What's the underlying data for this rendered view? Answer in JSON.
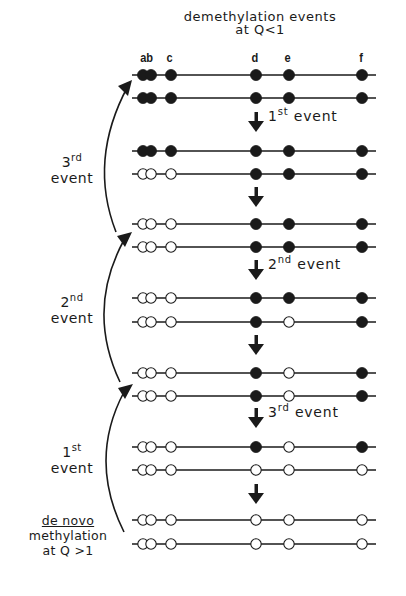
{
  "header": {
    "title_line1": "demethylation events",
    "title_line2": "at Q<1"
  },
  "sites": [
    {
      "label": "ab",
      "x": 147
    },
    {
      "label": "c",
      "x": 171
    },
    {
      "label": "d",
      "x": 256
    },
    {
      "label": "e",
      "x": 289
    },
    {
      "label": "f",
      "x": 362
    }
  ],
  "site_positions": {
    "a": 143,
    "b": 151,
    "c": 171,
    "d": 256,
    "e": 289,
    "f": 362
  },
  "strand_rows": [
    {
      "y": 75,
      "methylated": {
        "a": true,
        "b": true,
        "c": true,
        "d": true,
        "e": true,
        "f": true
      }
    },
    {
      "y": 98,
      "methylated": {
        "a": true,
        "b": true,
        "c": true,
        "d": true,
        "e": true,
        "f": true
      }
    },
    {
      "y": 151,
      "methylated": {
        "a": true,
        "b": true,
        "c": true,
        "d": true,
        "e": true,
        "f": true
      }
    },
    {
      "y": 174,
      "methylated": {
        "a": false,
        "b": false,
        "c": false,
        "d": true,
        "e": true,
        "f": true
      }
    },
    {
      "y": 224,
      "methylated": {
        "a": false,
        "b": false,
        "c": false,
        "d": true,
        "e": true,
        "f": true
      }
    },
    {
      "y": 247,
      "methylated": {
        "a": false,
        "b": false,
        "c": false,
        "d": true,
        "e": true,
        "f": true
      }
    },
    {
      "y": 298,
      "methylated": {
        "a": false,
        "b": false,
        "c": false,
        "d": true,
        "e": true,
        "f": true
      }
    },
    {
      "y": 322,
      "methylated": {
        "a": false,
        "b": false,
        "c": false,
        "d": true,
        "e": false,
        "f": true
      }
    },
    {
      "y": 373,
      "methylated": {
        "a": false,
        "b": false,
        "c": false,
        "d": true,
        "e": false,
        "f": true
      }
    },
    {
      "y": 396,
      "methylated": {
        "a": false,
        "b": false,
        "c": false,
        "d": true,
        "e": false,
        "f": true
      }
    },
    {
      "y": 447,
      "methylated": {
        "a": false,
        "b": false,
        "c": false,
        "d": true,
        "e": false,
        "f": true
      }
    },
    {
      "y": 470,
      "methylated": {
        "a": false,
        "b": false,
        "c": false,
        "d": false,
        "e": false,
        "f": false
      }
    },
    {
      "y": 520,
      "methylated": {
        "a": false,
        "b": false,
        "c": false,
        "d": false,
        "e": false,
        "f": false
      }
    },
    {
      "y": 544,
      "methylated": {
        "a": false,
        "b": false,
        "c": false,
        "d": false,
        "e": false,
        "f": false
      }
    }
  ],
  "down_arrows": [
    {
      "y": 112,
      "label_num": "1",
      "label_sup": "st",
      "label_text": "event"
    },
    {
      "y": 187,
      "label_num": "",
      "label_sup": "",
      "label_text": ""
    },
    {
      "y": 260,
      "label_num": "2",
      "label_sup": "nd",
      "label_text": "event"
    },
    {
      "y": 335,
      "label_num": "",
      "label_sup": "",
      "label_text": ""
    },
    {
      "y": 408,
      "label_num": "3",
      "label_sup": "rd",
      "label_text": "event"
    },
    {
      "y": 484,
      "label_num": "",
      "label_sup": "",
      "label_text": ""
    }
  ],
  "side_labels": {
    "third": {
      "num": "3",
      "sup": "rd",
      "text": "event"
    },
    "second": {
      "num": "2",
      "sup": "nd",
      "text": "event"
    },
    "first": {
      "num": "1",
      "sup": "st",
      "text": "event"
    },
    "denovo": {
      "line1": "de novo",
      "line2": "methylation",
      "line3": "at Q >1"
    }
  },
  "colors": {
    "ink": "#1a1a1a",
    "open": "#ffffff",
    "background": "#ffffff"
  }
}
